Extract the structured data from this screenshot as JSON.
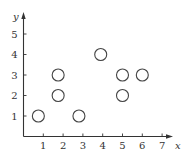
{
  "chart_data": {
    "type": "scatter",
    "title": "",
    "xlabel": "x",
    "ylabel": "y",
    "x_ticks": [
      1,
      2,
      3,
      4,
      5,
      6,
      7
    ],
    "y_ticks": [
      1,
      2,
      3,
      4,
      5
    ],
    "xlim": [
      0,
      7.5
    ],
    "ylim": [
      0,
      5.6
    ],
    "grid": false,
    "legend": null,
    "marker": "open-circle",
    "points": [
      {
        "x": 0.75,
        "y": 1
      },
      {
        "x": 1.75,
        "y": 2
      },
      {
        "x": 1.75,
        "y": 3
      },
      {
        "x": 2.8,
        "y": 1
      },
      {
        "x": 3.9,
        "y": 4
      },
      {
        "x": 5,
        "y": 2
      },
      {
        "x": 5,
        "y": 3
      },
      {
        "x": 6,
        "y": 3
      }
    ]
  },
  "style": {
    "axis_color": "#333333",
    "marker_stroke": "#444444"
  }
}
